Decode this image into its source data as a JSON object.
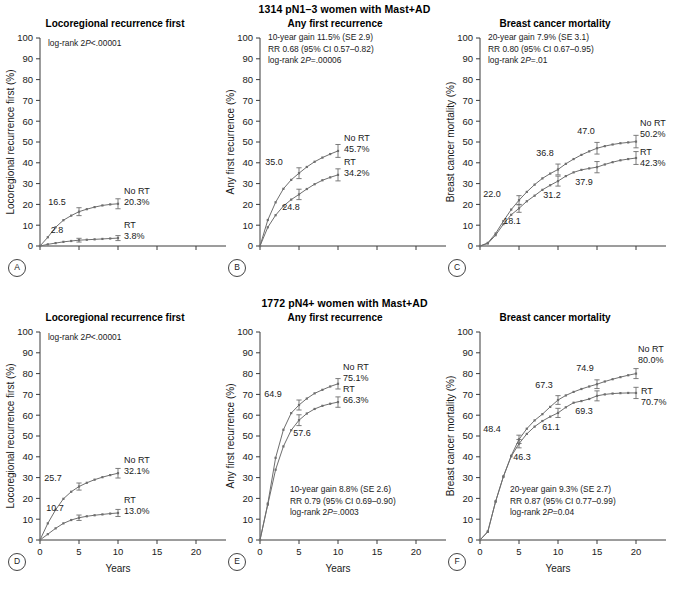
{
  "figure": {
    "width": 689,
    "height": 589,
    "axis_color": "#3a3a3a",
    "curve_color": "#6e6e6e"
  },
  "rows": [
    {
      "id": "row-top",
      "group_title": "1314 pN1–3 women with Mast+AD",
      "show_x_labels": false,
      "x_axis_title": ""
    },
    {
      "id": "row-bottom",
      "group_title": "1772 pN4+ women with Mast+AD",
      "show_x_labels": true,
      "x_axis_title": "Years"
    }
  ],
  "axes": {
    "y_ticks": [
      0,
      10,
      20,
      30,
      40,
      50,
      60,
      70,
      80,
      90,
      100
    ],
    "y_min": 0,
    "y_max": 100,
    "x_ticks": [
      0,
      5,
      10,
      15,
      20
    ],
    "x_min": 0,
    "x_max": 20
  },
  "chart_data": [
    {
      "panel": "A",
      "row": 0,
      "type": "line",
      "title": "Locoregional recurrence first",
      "ylabel": "Locoregional recurrence first (%)",
      "xlabel": "",
      "xlim": [
        0,
        20
      ],
      "ylim": [
        0,
        100
      ],
      "grid": false,
      "legend_position": "inline-right",
      "stats": [
        "log-rank 2P<.00001"
      ],
      "stats_x": 38,
      "stats_y": 46,
      "series": [
        {
          "name": "No RT",
          "end_label": "20.3%",
          "x": [
            0,
            1,
            2,
            3,
            4,
            5,
            6,
            7,
            8,
            9,
            10
          ],
          "values": [
            0.0,
            4.2,
            9.0,
            12.4,
            14.6,
            16.5,
            17.7,
            18.7,
            19.5,
            20.0,
            20.3
          ],
          "errorbars": [
            {
              "x": 5,
              "y": 16.5,
              "lo": 14.6,
              "hi": 18.4
            },
            {
              "x": 10,
              "y": 20.3,
              "lo": 17.9,
              "hi": 22.7
            }
          ],
          "point_labels": [
            {
              "x": 5,
              "y": 16.5,
              "text": "16.5",
              "dx": -22,
              "dy": -7
            }
          ],
          "label_dx": 6,
          "label_dy": -10
        },
        {
          "name": "RT",
          "end_label": "3.8%",
          "x": [
            0,
            1,
            2,
            3,
            4,
            5,
            6,
            7,
            8,
            9,
            10
          ],
          "values": [
            0.0,
            0.8,
            1.4,
            2.0,
            2.4,
            2.8,
            3.0,
            3.2,
            3.4,
            3.6,
            3.8
          ],
          "errorbars": [
            {
              "x": 5,
              "y": 2.8,
              "lo": 1.9,
              "hi": 3.7
            },
            {
              "x": 10,
              "y": 3.8,
              "lo": 2.6,
              "hi": 5.0
            }
          ],
          "point_labels": [
            {
              "x": 5,
              "y": 2.8,
              "text": "2.8",
              "dx": -22,
              "dy": -7
            }
          ],
          "label_dx": 6,
          "label_dy": -10
        }
      ]
    },
    {
      "panel": "B",
      "row": 0,
      "type": "line",
      "title": "Any first recurrence",
      "ylabel": "Any first recurrence (%)",
      "xlabel": "",
      "xlim": [
        0,
        20
      ],
      "ylim": [
        0,
        100
      ],
      "grid": false,
      "legend_position": "inline-right",
      "stats": [
        "10-year gain 11.5% (SE 2.9)",
        "RR 0.68 (95% CI 0.57–0.82)",
        "log-rank 2P=.00006"
      ],
      "stats_x": 38,
      "stats_y": 40,
      "series": [
        {
          "name": "No RT",
          "end_label": "45.7%",
          "x": [
            0,
            1,
            2,
            3,
            4,
            5,
            6,
            7,
            8,
            9,
            10
          ],
          "values": [
            0.0,
            12.5,
            21.0,
            27.5,
            31.8,
            35.0,
            38.0,
            40.5,
            42.5,
            44.2,
            45.7
          ],
          "errorbars": [
            {
              "x": 5,
              "y": 35.0,
              "lo": 32.4,
              "hi": 37.6
            },
            {
              "x": 10,
              "y": 45.7,
              "lo": 42.6,
              "hi": 48.8
            }
          ],
          "point_labels": [
            {
              "x": 5,
              "y": 35.0,
              "text": "35.0",
              "dx": -25,
              "dy": -8
            }
          ],
          "label_dx": 6,
          "label_dy": -10
        },
        {
          "name": "RT",
          "end_label": "34.2%",
          "x": [
            0,
            1,
            2,
            3,
            4,
            5,
            6,
            7,
            8,
            9,
            10
          ],
          "values": [
            0.0,
            9.0,
            14.8,
            19.2,
            22.3,
            24.8,
            27.4,
            29.7,
            31.6,
            33.0,
            34.2
          ],
          "errorbars": [
            {
              "x": 5,
              "y": 24.8,
              "lo": 22.3,
              "hi": 27.3
            },
            {
              "x": 10,
              "y": 34.2,
              "lo": 31.3,
              "hi": 37.1
            }
          ],
          "point_labels": [
            {
              "x": 5,
              "y": 24.8,
              "text": "24.8",
              "dx": -8,
              "dy": 16
            }
          ],
          "label_dx": 6,
          "label_dy": -10
        }
      ]
    },
    {
      "panel": "C",
      "row": 0,
      "type": "line",
      "title": "Breast cancer mortality",
      "ylabel": "Breast cancer mortality (%)",
      "xlabel": "",
      "xlim": [
        0,
        20
      ],
      "ylim": [
        0,
        100
      ],
      "grid": false,
      "legend_position": "inline-right",
      "stats": [
        "20-year gain 7.9% (SE 3.1)",
        "RR 0.80 (95% CI 0.67–0.95)",
        "log-rank 2P=.01"
      ],
      "stats_x": 38,
      "stats_y": 40,
      "series": [
        {
          "name": "No RT",
          "end_label": "50.2%",
          "x": [
            0,
            1,
            2,
            3,
            4,
            5,
            6,
            7,
            8,
            9,
            10,
            11,
            12,
            13,
            14,
            15,
            16,
            17,
            18,
            19,
            20
          ],
          "values": [
            0.0,
            1.5,
            6.0,
            12.0,
            17.5,
            22.0,
            26.0,
            29.5,
            32.5,
            34.8,
            36.8,
            39.5,
            41.8,
            43.8,
            45.5,
            47.0,
            48.0,
            48.8,
            49.4,
            49.8,
            50.2
          ],
          "errorbars": [
            {
              "x": 5,
              "y": 22.0,
              "lo": 19.8,
              "hi": 24.2
            },
            {
              "x": 10,
              "y": 36.8,
              "lo": 34.2,
              "hi": 39.4
            },
            {
              "x": 15,
              "y": 47.0,
              "lo": 44.2,
              "hi": 49.8
            },
            {
              "x": 20,
              "y": 50.2,
              "lo": 47.2,
              "hi": 53.2
            }
          ],
          "point_labels": [
            {
              "x": 5,
              "y": 22.0,
              "text": "22.0",
              "dx": -27,
              "dy": -3
            },
            {
              "x": 10,
              "y": 36.8,
              "text": "36.8",
              "dx": -13,
              "dy": -13
            },
            {
              "x": 15,
              "y": 47.0,
              "text": "47.0",
              "dx": -11,
              "dy": -14
            }
          ],
          "label_dx": 4,
          "label_dy": -16
        },
        {
          "name": "RT",
          "end_label": "42.3%",
          "x": [
            0,
            1,
            2,
            3,
            4,
            5,
            6,
            7,
            8,
            9,
            10,
            11,
            12,
            13,
            14,
            15,
            16,
            17,
            18,
            19,
            20
          ],
          "values": [
            0.0,
            1.2,
            5.2,
            10.5,
            15.0,
            18.1,
            21.5,
            24.2,
            27.0,
            29.2,
            31.2,
            33.6,
            35.4,
            36.6,
            37.3,
            37.9,
            39.2,
            40.3,
            41.2,
            41.8,
            42.3
          ],
          "errorbars": [
            {
              "x": 5,
              "y": 18.1,
              "lo": 16.2,
              "hi": 20.0
            },
            {
              "x": 10,
              "y": 31.2,
              "lo": 28.8,
              "hi": 33.6
            },
            {
              "x": 15,
              "y": 37.9,
              "lo": 35.2,
              "hi": 40.6
            },
            {
              "x": 20,
              "y": 42.3,
              "lo": 39.2,
              "hi": 45.4
            }
          ],
          "point_labels": [
            {
              "x": 5,
              "y": 18.1,
              "text": "18.1",
              "dx": -7,
              "dy": 16
            },
            {
              "x": 10,
              "y": 31.2,
              "text": "31.2",
              "dx": -6,
              "dy": 17
            },
            {
              "x": 15,
              "y": 37.9,
              "text": "37.9",
              "dx": -13,
              "dy": 18
            }
          ],
          "label_dx": 4,
          "label_dy": -3
        }
      ]
    },
    {
      "panel": "D",
      "row": 1,
      "type": "line",
      "title": "Locoregional recurrence first",
      "ylabel": "Locoregional recurrence first (%)",
      "xlabel": "Years",
      "xlim": [
        0,
        20
      ],
      "ylim": [
        0,
        100
      ],
      "grid": false,
      "legend_position": "inline-right",
      "stats": [
        "log-rank 2P<.00001"
      ],
      "stats_x": 38,
      "stats_y": 46,
      "series": [
        {
          "name": "No RT",
          "end_label": "32.1%",
          "x": [
            0,
            1,
            2,
            3,
            4,
            5,
            6,
            7,
            8,
            9,
            10
          ],
          "values": [
            0.0,
            8.0,
            14.5,
            19.8,
            23.2,
            25.7,
            27.5,
            29.0,
            30.2,
            31.2,
            32.1
          ],
          "errorbars": [
            {
              "x": 5,
              "y": 25.7,
              "lo": 24.0,
              "hi": 27.4
            },
            {
              "x": 10,
              "y": 32.1,
              "lo": 29.8,
              "hi": 34.4
            }
          ],
          "point_labels": [
            {
              "x": 5,
              "y": 25.7,
              "text": "25.7",
              "dx": -26,
              "dy": -6
            }
          ],
          "label_dx": 6,
          "label_dy": -10
        },
        {
          "name": "RT",
          "end_label": "13.0%",
          "x": [
            0,
            1,
            2,
            3,
            4,
            5,
            6,
            7,
            8,
            9,
            10
          ],
          "values": [
            0.0,
            2.8,
            5.6,
            8.0,
            9.6,
            10.7,
            11.4,
            11.9,
            12.3,
            12.7,
            13.0
          ],
          "errorbars": [
            {
              "x": 5,
              "y": 10.7,
              "lo": 9.4,
              "hi": 12.0
            },
            {
              "x": 10,
              "y": 13.0,
              "lo": 11.3,
              "hi": 14.7
            }
          ],
          "point_labels": [
            {
              "x": 5,
              "y": 10.7,
              "text": "10.7",
              "dx": -24,
              "dy": -7
            }
          ],
          "label_dx": 6,
          "label_dy": -10
        }
      ]
    },
    {
      "panel": "E",
      "row": 1,
      "type": "line",
      "title": "Any first recurrence",
      "ylabel": "Any first recurrence (%)",
      "xlabel": "Years",
      "xlim": [
        0,
        20
      ],
      "ylim": [
        0,
        100
      ],
      "grid": false,
      "legend_position": "inline-right",
      "stats": [
        "10-year gain 8.8% (SE 2.6)",
        "RR 0.79 (95% CI 0.69–0.90)",
        "log-rank 2P=.0003"
      ],
      "stats_x": 60,
      "stats_y": 198,
      "series": [
        {
          "name": "No RT",
          "end_label": "75.1%",
          "x": [
            0,
            1,
            2,
            3,
            4,
            5,
            6,
            7,
            8,
            9,
            10
          ],
          "values": [
            0.0,
            17.5,
            39.5,
            53.0,
            61.0,
            64.9,
            68.0,
            70.5,
            72.2,
            73.8,
            75.1
          ],
          "errorbars": [
            {
              "x": 5,
              "y": 64.9,
              "lo": 62.5,
              "hi": 67.3
            },
            {
              "x": 10,
              "y": 75.1,
              "lo": 72.6,
              "hi": 77.6
            }
          ],
          "point_labels": [
            {
              "x": 5,
              "y": 64.9,
              "text": "64.9",
              "dx": -26,
              "dy": -8
            }
          ],
          "label_dx": 5,
          "label_dy": -14
        },
        {
          "name": "RT",
          "end_label": "66.3%",
          "x": [
            0,
            1,
            2,
            3,
            4,
            5,
            6,
            7,
            8,
            9,
            10
          ],
          "values": [
            0.0,
            17.0,
            33.8,
            45.0,
            52.8,
            57.6,
            60.8,
            63.0,
            64.5,
            65.5,
            66.3
          ],
          "errorbars": [
            {
              "x": 5,
              "y": 57.6,
              "lo": 55.0,
              "hi": 60.2
            },
            {
              "x": 10,
              "y": 66.3,
              "lo": 63.8,
              "hi": 68.8
            }
          ],
          "point_labels": [
            {
              "x": 5,
              "y": 57.6,
              "text": "57.6",
              "dx": 3,
              "dy": 16
            }
          ],
          "label_dx": 5,
          "label_dy": -10
        }
      ]
    },
    {
      "panel": "F",
      "row": 1,
      "type": "line",
      "title": "Breast cancer mortality",
      "ylabel": "Breast cancer mortality (%)",
      "xlabel": "Years",
      "xlim": [
        0,
        20
      ],
      "ylim": [
        0,
        100
      ],
      "grid": false,
      "legend_position": "inline-right",
      "stats": [
        "20-year gain 9.3% (SE 2.7)",
        "RR 0.87 (95% CI 0.77–0.99)",
        "log-rank 2P=0.04"
      ],
      "stats_x": 60,
      "stats_y": 198,
      "series": [
        {
          "name": "No RT",
          "end_label": "80.0%",
          "x": [
            0,
            1,
            2,
            3,
            4,
            5,
            6,
            7,
            8,
            9,
            10,
            11,
            12,
            13,
            14,
            15,
            16,
            17,
            18,
            19,
            20
          ],
          "values": [
            0.0,
            4.0,
            18.5,
            30.5,
            40.5,
            48.4,
            53.5,
            57.5,
            60.5,
            64.0,
            67.3,
            69.5,
            71.2,
            72.6,
            73.8,
            74.9,
            76.2,
            77.3,
            78.3,
            79.2,
            80.0
          ],
          "errorbars": [
            {
              "x": 5,
              "y": 48.4,
              "lo": 46.4,
              "hi": 50.4
            },
            {
              "x": 10,
              "y": 67.3,
              "lo": 65.2,
              "hi": 69.4
            },
            {
              "x": 15,
              "y": 74.9,
              "lo": 72.8,
              "hi": 77.0
            },
            {
              "x": 20,
              "y": 80.0,
              "lo": 77.6,
              "hi": 82.4
            }
          ],
          "point_labels": [
            {
              "x": 5,
              "y": 48.4,
              "text": "48.4",
              "dx": -27,
              "dy": -7
            },
            {
              "x": 10,
              "y": 67.3,
              "text": "67.3",
              "dx": -14,
              "dy": -12
            },
            {
              "x": 15,
              "y": 74.9,
              "text": "74.9",
              "dx": -12,
              "dy": -13
            }
          ],
          "label_dx": 2,
          "label_dy": -22
        },
        {
          "name": "RT",
          "end_label": "70.7%",
          "x": [
            0,
            1,
            2,
            3,
            4,
            5,
            6,
            7,
            8,
            9,
            10,
            11,
            12,
            13,
            14,
            15,
            16,
            17,
            18,
            19,
            20
          ],
          "values": [
            0.0,
            4.0,
            18.5,
            30.5,
            40.2,
            46.3,
            51.0,
            54.5,
            57.2,
            59.3,
            61.1,
            63.8,
            66.0,
            66.8,
            67.8,
            69.3,
            70.0,
            70.4,
            70.6,
            70.7,
            70.7
          ],
          "errorbars": [
            {
              "x": 5,
              "y": 46.3,
              "lo": 44.3,
              "hi": 48.3
            },
            {
              "x": 10,
              "y": 61.1,
              "lo": 58.9,
              "hi": 63.3
            },
            {
              "x": 15,
              "y": 69.3,
              "lo": 66.9,
              "hi": 71.7
            },
            {
              "x": 20,
              "y": 70.7,
              "lo": 68.0,
              "hi": 73.4
            }
          ],
          "point_labels": [
            {
              "x": 5,
              "y": 46.3,
              "text": "46.3",
              "dx": 3,
              "dy": 16
            },
            {
              "x": 10,
              "y": 61.1,
              "text": "61.1",
              "dx": -7,
              "dy": 17
            },
            {
              "x": 15,
              "y": 69.3,
              "text": "69.3",
              "dx": -13,
              "dy": 18
            }
          ],
          "label_dx": 5,
          "label_dy": 1
        }
      ]
    }
  ]
}
